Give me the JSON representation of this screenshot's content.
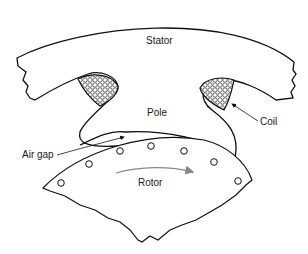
{
  "labels": {
    "stator": "Stator",
    "pole": "Pole",
    "coil": "Coil",
    "air_gap": "Air gap",
    "rotor": "Rotor"
  },
  "colors": {
    "line": "#111111",
    "arrow": "#888888",
    "background": "#ffffff"
  }
}
